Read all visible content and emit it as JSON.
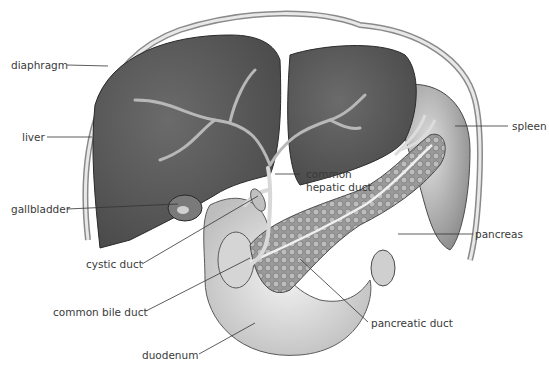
{
  "figure": {
    "labels": {
      "diaphragm": "diaphragm",
      "liver": "liver",
      "gallbladder": "gallbladder",
      "cystic_duct": "cystic duct",
      "common_bile_duct": "common bile duct",
      "duodenum": "duodenum",
      "common_hepatic_duct_1": "common",
      "common_hepatic_duct_2": "hepatic duct",
      "spleen": "spleen",
      "pancreas": "pancreas",
      "pancreatic_duct": "pancreatic duct"
    },
    "colors": {
      "liver": "#5a5a5a",
      "duct": "#c8c8c8",
      "pancreas": "#8a8a8a",
      "duodenum": "#d8d8d8",
      "leader": "#333333",
      "text": "#3a3a3a"
    }
  }
}
